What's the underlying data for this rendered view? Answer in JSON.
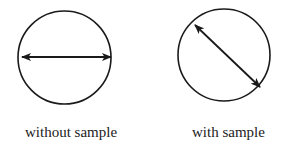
{
  "figure": {
    "panels": [
      {
        "id": "without-sample",
        "label": "without sample",
        "circle": {
          "cx": 64.5,
          "cy": 57.5,
          "r": 46.5
        },
        "arrow": {
          "x1": 22,
          "y1": 57,
          "x2": 111,
          "y2": 57,
          "orientation": "horizontal",
          "double_headed": true
        }
      },
      {
        "id": "with-sample",
        "label": "with sample",
        "circle": {
          "cx": 224,
          "cy": 55,
          "r": 46
        },
        "arrow": {
          "x1": 195,
          "y1": 25,
          "x2": 260,
          "y2": 87,
          "orientation": "diagonal",
          "double_headed": true
        }
      }
    ],
    "colors": {
      "stroke": "#1a1a1a",
      "text": "#222222",
      "background": "#ffffff"
    }
  }
}
